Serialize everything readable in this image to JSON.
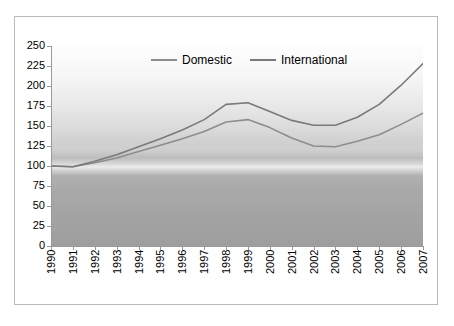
{
  "chart_data": {
    "type": "line",
    "title": "",
    "subtitle": "",
    "xlabel": "",
    "ylabel": "",
    "grid": false,
    "legend_position": "top-center",
    "categories": [
      "1990",
      "1991",
      "1992",
      "1993",
      "1994",
      "1995",
      "1996",
      "1997",
      "1998",
      "1999",
      "2000",
      "2001",
      "2002",
      "2003",
      "2004",
      "2005",
      "2006",
      "2007"
    ],
    "x": [
      1990,
      1991,
      1992,
      1993,
      1994,
      1995,
      1996,
      1997,
      1998,
      1999,
      2000,
      2001,
      2002,
      2003,
      2004,
      2005,
      2006,
      2007
    ],
    "ylim": [
      0,
      250
    ],
    "yticks": [
      0,
      25,
      50,
      75,
      100,
      125,
      150,
      175,
      200,
      225,
      250
    ],
    "ytick_labels": [
      "0",
      "25",
      "50",
      "75",
      "100",
      "125",
      "150",
      "175",
      "200",
      "225",
      "250"
    ],
    "series": [
      {
        "name": "Domestic",
        "color": "#8d8d8d",
        "values": [
          100,
          99,
          104,
          110,
          118,
          126,
          134,
          143,
          155,
          158,
          148,
          135,
          125,
          124,
          131,
          139,
          152,
          166
        ]
      },
      {
        "name": "International",
        "color": "#7a7a7a",
        "values": [
          100,
          99,
          106,
          114,
          124,
          134,
          145,
          158,
          177,
          179,
          168,
          157,
          151,
          151,
          161,
          177,
          201,
          228
        ]
      }
    ],
    "legend": [
      "Domestic",
      "International"
    ],
    "annotations": []
  },
  "legend": {
    "items": [
      {
        "label": "Domestic"
      },
      {
        "label": "International"
      }
    ]
  },
  "colors": {
    "domestic": "#8d8d8d",
    "international": "#7a7a7a",
    "axis": "#9a9a9a",
    "frame": "#b9b9b9",
    "text": "#000000"
  }
}
